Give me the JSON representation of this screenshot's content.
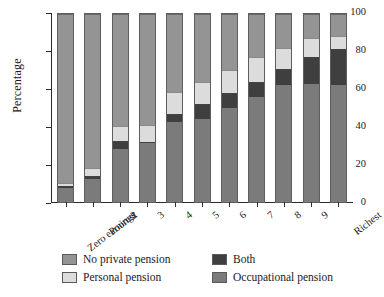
{
  "chart_data": {
    "type": "bar",
    "stacked": true,
    "title": "",
    "subtitle": "",
    "xlabel": "",
    "ylabel": "Percentage",
    "ylim": [
      0,
      100
    ],
    "yticks": [
      0,
      20,
      40,
      60,
      80,
      100
    ],
    "ytick_labels": [
      "0",
      "20",
      "40",
      "60",
      "80",
      "100"
    ],
    "grid": false,
    "legend_position": "bottom",
    "categories": [
      "Zero earnings",
      "Poorest",
      "2",
      "3",
      "4",
      "5",
      "6",
      "7",
      "8",
      "9",
      "Richest"
    ],
    "series": [
      {
        "name": "Occupational pension",
        "color": "#7b7b7b",
        "values": [
          7.5,
          12.5,
          28.0,
          31.5,
          42.5,
          44.0,
          50.0,
          56.0,
          62.5,
          63.0,
          62.5
        ]
      },
      {
        "name": "Both",
        "color": "#3f3f3f",
        "values": [
          1.0,
          1.5,
          4.5,
          0.5,
          4.5,
          8.0,
          8.0,
          8.0,
          8.0,
          14.0,
          19.0
        ]
      },
      {
        "name": "Personal pension",
        "color": "#dcdcdc",
        "values": [
          1.5,
          4.0,
          8.0,
          9.0,
          11.5,
          12.0,
          12.0,
          13.0,
          11.5,
          10.0,
          7.0
        ]
      },
      {
        "name": "No private pension",
        "color": "#949494",
        "values": [
          90.0,
          82.0,
          59.5,
          59.0,
          41.5,
          36.0,
          30.0,
          23.0,
          18.0,
          13.0,
          11.5
        ]
      }
    ],
    "segment_order_bottom_to_top": [
      "Occupational pension",
      "Both",
      "Personal pension",
      "No private pension"
    ]
  },
  "legend": {
    "entries": [
      {
        "label": "No private pension",
        "color": "#949494"
      },
      {
        "label": "Both",
        "color": "#3f3f3f"
      },
      {
        "label": "Personal pension",
        "color": "#dcdcdc"
      },
      {
        "label": "Occupational pension",
        "color": "#7b7b7b"
      }
    ]
  }
}
